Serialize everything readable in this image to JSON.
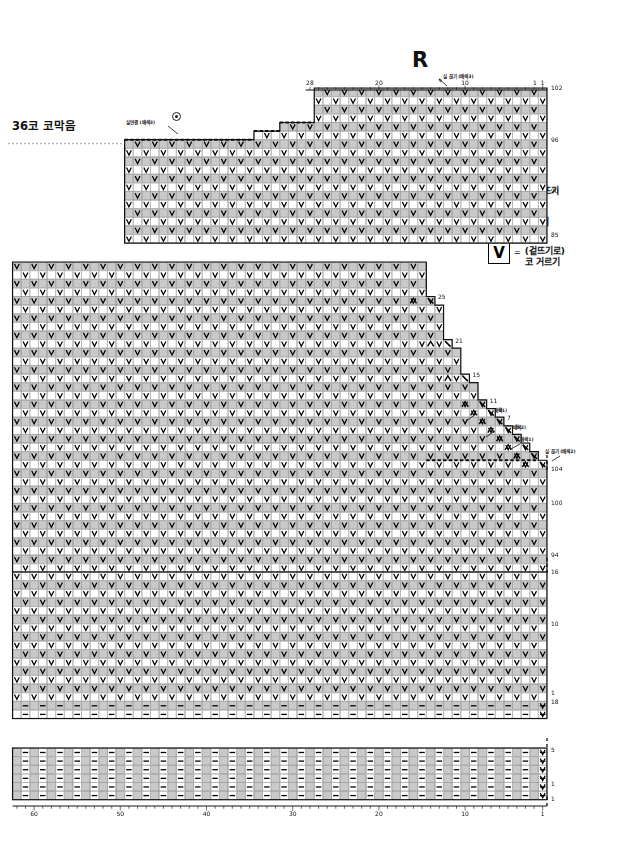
{
  "page": {
    "title_letter": "R",
    "background": "#ffffff",
    "ink": "#111111",
    "cell_shade": "#c9c9c9",
    "cell_light": "#ffffff",
    "grid_line": "#8d8d8d",
    "outline": "#111111"
  },
  "labels": {
    "bind_off_36": "36코 코막음",
    "yarn_join_top": "실연결 (배색3)",
    "yarn_cut_top_right": "실 끊기 (배색3)",
    "yarn_join_r5": "실연결 (배색1)",
    "yarn_join_r1": "실연결 (배색2)",
    "yarn_cut_r1": "실 끊기 (배색1)",
    "yarn_cut_right_low": "실 끊기 (배색2)"
  },
  "legend": {
    "title": "",
    "items": [
      {
        "boxes": [
          "blank",
          "diagonal"
        ],
        "equals": "=",
        "label": "겉뜨기",
        "icon": "knit-diagonal-icon"
      },
      {
        "boxes": [
          "purl-bar"
        ],
        "equals": "=",
        "label": "안뜨기",
        "icon": "purl-bar-icon"
      },
      {
        "boxes": [
          "v-slip"
        ],
        "equals": "=",
        "label": "(겉뜨기로)\n코 거르기",
        "label_line1": "(겉뜨기로)",
        "label_line2": "코 거르기",
        "icon": "slip-stitch-v-icon"
      }
    ]
  },
  "axes": {
    "top": {
      "ticks": [
        {
          "value": "28",
          "stitch": 28
        },
        {
          "value": "20",
          "stitch": 20
        },
        {
          "value": "10",
          "stitch": 10
        },
        {
          "value": "1",
          "stitch": 1
        }
      ]
    },
    "bottom": {
      "ticks": [
        {
          "value": "60",
          "stitch": 60
        },
        {
          "value": "50",
          "stitch": 50
        },
        {
          "value": "40",
          "stitch": 40
        },
        {
          "value": "30",
          "stitch": 30
        },
        {
          "value": "20",
          "stitch": 20
        },
        {
          "value": "10",
          "stitch": 10
        },
        {
          "value": "1",
          "stitch": 1
        }
      ]
    }
  },
  "blocks": [
    {
      "id": "block-top",
      "name": "top-yoke-block",
      "row_labels": [
        "102",
        "96",
        "90",
        "85"
      ],
      "rows": 18,
      "cols": 49,
      "notes": "stepped bind-off at upper-left, slip-stitch mosaic"
    },
    {
      "id": "block-middle",
      "name": "middle-shaping-block",
      "row_labels_left": [
        "25",
        "21",
        "15",
        "11",
        "9",
        "7",
        "5"
      ],
      "row_labels_right": [
        "104",
        "100",
        "94"
      ],
      "rows": 36,
      "cols": 62,
      "notes": "right-edge staircase decreases"
    },
    {
      "id": "block-lower",
      "name": "lower-body-block",
      "row_labels": [
        "16",
        "10",
        "1",
        "18"
      ],
      "rows": 17,
      "cols": 62
    },
    {
      "id": "block-rib",
      "name": "ribbing-block",
      "row_labels": [
        "5",
        "1",
        "1"
      ],
      "rows": 6,
      "cols": 62
    }
  ],
  "row_numbers": {
    "top_block": [
      "102",
      "96",
      "90",
      "85"
    ],
    "middle_left": [
      "25",
      "21",
      "15",
      "11",
      "9",
      "7",
      "5"
    ],
    "middle_right": [
      "104",
      "100",
      "94"
    ],
    "lower_block": [
      "16",
      "10",
      "1",
      "18"
    ],
    "rib_block": [
      "5",
      "1",
      "1"
    ]
  },
  "symbols": {
    "slip": "V",
    "purl": "—",
    "decrease_left": "Λ",
    "decrease_right": "＼"
  }
}
